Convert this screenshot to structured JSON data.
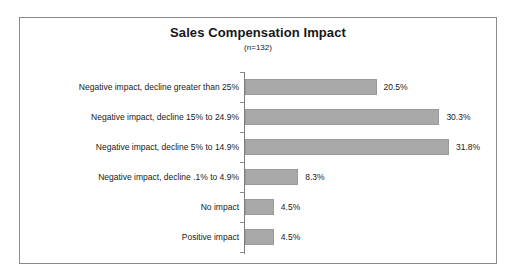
{
  "chart_data": {
    "type": "bar",
    "orientation": "horizontal",
    "title": "Sales Compensation Impact",
    "subtitle": "(n=132)",
    "xlabel": "",
    "ylabel": "",
    "xlim": [
      0,
      33
    ],
    "grid": false,
    "legend": null,
    "bar_color": "#a9a9a9",
    "frame_color": "#8a8a8a",
    "axis_color": "#7d7d7d",
    "categories": [
      "Negative impact, decline greater than 25%",
      "Negative impact, decline 15% to 24.9%",
      "Negative impact, decline 5% to 14.9%",
      "Negative impact, decline .1% to 4.9%",
      "No impact",
      "Positive impact"
    ],
    "values": [
      20.5,
      30.3,
      31.8,
      8.3,
      4.5,
      4.5
    ],
    "value_labels": [
      "20.5%",
      "30.3%",
      "31.8%",
      "8.3%",
      "4.5%",
      "4.5%"
    ]
  }
}
